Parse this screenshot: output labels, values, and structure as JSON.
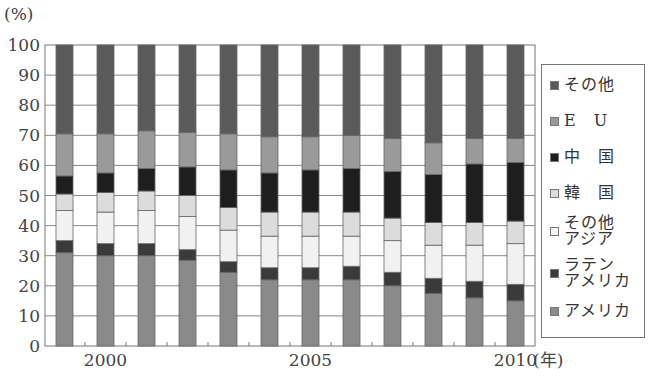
{
  "chart_data": {
    "type": "bar",
    "stacked": true,
    "title": "",
    "xlabel": "(年)",
    "ylabel": "(%)",
    "ylim": [
      0,
      100
    ],
    "yticks": [
      0,
      10,
      20,
      30,
      40,
      50,
      60,
      70,
      80,
      90,
      100
    ],
    "xtick_labels": [
      {
        "label": "2000",
        "index": 1
      },
      {
        "label": "2005",
        "index": 6
      },
      {
        "label": "2010",
        "index": 11
      }
    ],
    "grid": true,
    "legend_position": "right",
    "categories": [
      "1999",
      "2000",
      "2001",
      "2002",
      "2003",
      "2004",
      "2005",
      "2006",
      "2007",
      "2008",
      "2009",
      "2010"
    ],
    "series": [
      {
        "name": "アメリカ",
        "color": "#8a8a8a",
        "values": [
          31,
          30,
          30,
          28.5,
          24.5,
          22,
          22,
          22,
          20,
          17.5,
          16,
          15
        ]
      },
      {
        "name": "ラテンアメリカ",
        "color": "#3a3a3a",
        "values": [
          4,
          4,
          4,
          3.5,
          3.5,
          4,
          4,
          4.5,
          4.5,
          5,
          5.5,
          5.5
        ]
      },
      {
        "name": "その他アジア",
        "color": "#f1f1f1",
        "values": [
          10,
          10.5,
          11,
          11,
          10.5,
          10.5,
          10.5,
          10,
          10.5,
          11,
          12,
          13.5
        ]
      },
      {
        "name": "韓国",
        "color": "#dcdcdc",
        "values": [
          5.5,
          6.5,
          6.5,
          7,
          7.5,
          8,
          8,
          8,
          7.5,
          7.5,
          7.5,
          7.5
        ]
      },
      {
        "name": "中国",
        "color": "#1e1e1e",
        "values": [
          6,
          6.5,
          7.5,
          9.5,
          12.5,
          13,
          14,
          14.5,
          15.5,
          16,
          19.5,
          19.5
        ]
      },
      {
        "name": "EU",
        "color": "#9a9a9a",
        "values": [
          14,
          13,
          12.5,
          11.5,
          12,
          12,
          11,
          11,
          11,
          10.5,
          8.5,
          8
        ]
      },
      {
        "name": "その他",
        "color": "#5a5a5a",
        "values": [
          29.5,
          29.5,
          28.5,
          29,
          29.5,
          30.5,
          30.5,
          30,
          31,
          32.5,
          31,
          31
        ]
      }
    ]
  },
  "labels": {
    "y_unit": "(%)",
    "x_unit": "(年)"
  },
  "legend": [
    {
      "label": "その他",
      "color": "#5a5a5a",
      "wide": false
    },
    {
      "label": "EU",
      "color": "#9a9a9a",
      "wide": true
    },
    {
      "label": "中国",
      "color": "#1e1e1e",
      "wide": true
    },
    {
      "label": "韓国",
      "color": "#dcdcdc",
      "wide": true
    },
    {
      "label": "その他\nアジア",
      "color": "#f4f4f4",
      "wide": false
    },
    {
      "label": "ラテン\nアメリカ",
      "color": "#3a3a3a",
      "wide": false
    },
    {
      "label": "アメリカ",
      "color": "#8a8a8a",
      "wide": false
    }
  ]
}
